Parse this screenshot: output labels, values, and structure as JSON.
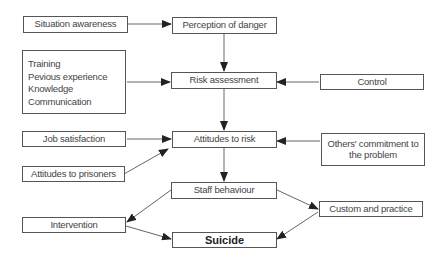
{
  "diagram": {
    "nodes": {
      "situation_awareness": "Situation awareness",
      "perception_of_danger": "Perception of danger",
      "factors": [
        "Training",
        "Pevious experience",
        "Knowledge",
        "Communication"
      ],
      "risk_assessment": "Risk assessment",
      "control": "Control",
      "job_satisfaction": "Job satisfaction",
      "attitudes_to_risk": "Attitudes to risk",
      "others_commitment": "Others' commitment to the problem",
      "attitudes_to_prisoners": "Attitudes to prisoners",
      "staff_behaviour": "Staff behaviour",
      "custom_and_practice": "Custom and practice",
      "intervention": "Intervention",
      "suicide": "Suicide"
    },
    "edges": [
      {
        "from": "Situation awareness",
        "to": "Perception of danger"
      },
      {
        "from": "Perception of danger",
        "to": "Risk assessment"
      },
      {
        "from": "Training / Pevious experience / Knowledge / Communication",
        "to": "Risk assessment"
      },
      {
        "from": "Control",
        "to": "Risk assessment"
      },
      {
        "from": "Risk assessment",
        "to": "Attitudes to risk"
      },
      {
        "from": "Job satisfaction",
        "to": "Attitudes to risk"
      },
      {
        "from": "Attitudes to prisoners",
        "to": "Attitudes to risk"
      },
      {
        "from": "Others' commitment to the problem",
        "to": "Attitudes to risk"
      },
      {
        "from": "Attitudes to risk",
        "to": "Staff behaviour"
      },
      {
        "from": "Staff behaviour",
        "to": "Intervention"
      },
      {
        "from": "Staff behaviour",
        "to": "Custom and practice"
      },
      {
        "from": "Intervention",
        "to": "Suicide"
      },
      {
        "from": "Custom and practice",
        "to": "Suicide"
      }
    ],
    "colors": {
      "line": "#555555",
      "arrow": "#222222",
      "text": "#444444"
    }
  }
}
